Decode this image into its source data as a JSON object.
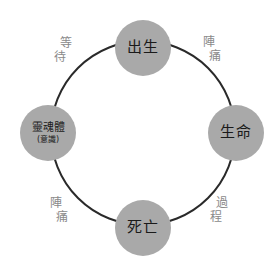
{
  "diagram": {
    "type": "cycle",
    "ring_color": "#2a2a2a",
    "node_color": "#a9a9a9",
    "label_color": "#8a8a8a",
    "nodes": {
      "top": {
        "label": "出生"
      },
      "right": {
        "label": "生命"
      },
      "bottom": {
        "label": "死亡"
      },
      "left": {
        "label": "靈魂體",
        "sublabel": "(意識)"
      }
    },
    "edges": {
      "top_right": {
        "chars": [
          "陣",
          "痛"
        ]
      },
      "right_bottom": {
        "chars": [
          "過",
          "程"
        ]
      },
      "bottom_left": {
        "chars": [
          "陣",
          "痛"
        ]
      },
      "left_top": {
        "chars": [
          "等",
          "待"
        ]
      }
    }
  }
}
